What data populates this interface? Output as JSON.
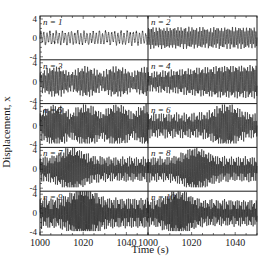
{
  "chart_data": {
    "type": "line",
    "title": "",
    "xlabel": "Time (s)",
    "ylabel": "Displacement, x",
    "layout": {
      "rows": 5,
      "cols": 2,
      "grid": false,
      "legend": "none"
    },
    "xlim": [
      1000,
      1050
    ],
    "ylim": [
      -4,
      4
    ],
    "xticks": [
      "1000",
      "1020",
      "1040"
    ],
    "yticks": [
      "4",
      "0",
      "-4"
    ],
    "panels": [
      {
        "label": "n = 1",
        "n": 1,
        "amplitude": 1.2,
        "freq": 0.7,
        "envelope": "flat",
        "burst_center": null
      },
      {
        "label": "n = 2",
        "n": 2,
        "amplitude": 1.8,
        "freq": 1.4,
        "envelope": "flat",
        "burst_center": null
      },
      {
        "label": "n = 3",
        "n": 3,
        "amplitude": 2.6,
        "freq": 1.6,
        "envelope": "beating",
        "burst_center": null
      },
      {
        "label": "n = 4",
        "n": 4,
        "amplitude": 2.8,
        "freq": 1.8,
        "envelope": "growing",
        "burst_center": 1035
      },
      {
        "label": "n = 5",
        "n": 5,
        "amplitude": 3.6,
        "freq": 2.0,
        "envelope": "beating",
        "burst_center": 1022
      },
      {
        "label": "n = 6",
        "n": 6,
        "amplitude": 3.8,
        "freq": 2.0,
        "envelope": "burst",
        "burst_center": 1036
      },
      {
        "label": "n = 7",
        "n": 7,
        "amplitude": 3.8,
        "freq": 2.2,
        "envelope": "burst",
        "burst_center": 1015
      },
      {
        "label": "n = 8",
        "n": 8,
        "amplitude": 3.8,
        "freq": 2.2,
        "envelope": "burst",
        "burst_center": 1022
      },
      {
        "label": "n = 9",
        "n": 9,
        "amplitude": 4.6,
        "freq": 2.4,
        "envelope": "burst",
        "burst_center": 1020
      },
      {
        "label": "n = 10",
        "n": 10,
        "amplitude": 4.0,
        "freq": 2.4,
        "envelope": "burst",
        "burst_center": 1014
      }
    ]
  }
}
